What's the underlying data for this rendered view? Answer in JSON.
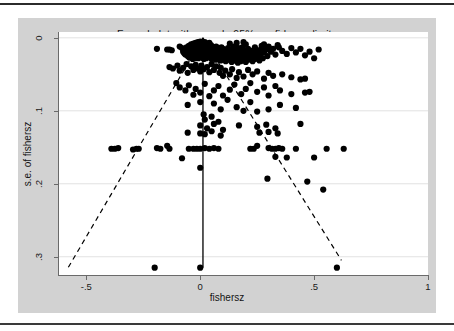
{
  "figure": {
    "title": "Funnel plot with pseudo 95% confidence limits",
    "panel_background": "#d2d2d2",
    "plot_background": "#ffffff",
    "axis_color": "#6a6a6a",
    "grid_color": "#e2e2e2",
    "point_color": "#000000",
    "line_color": "#000000"
  },
  "chart_data": {
    "type": "scatter",
    "title": "Funnel plot with pseudo 95% confidence limits",
    "xlabel": "fishersz",
    "ylabel": "s.e. of fishersz",
    "xlim": [
      -0.62,
      1.0
    ],
    "ylim": [
      0.325,
      -0.008
    ],
    "y_inverted": true,
    "grid": true,
    "grid_axis": "y",
    "legend": "none",
    "xticks": [
      -0.5,
      0,
      0.5,
      1
    ],
    "xticklabels": [
      "-.5",
      "0",
      ".5",
      "1"
    ],
    "yticks": [
      0,
      0.1,
      0.2,
      0.3
    ],
    "yticklabels": [
      "0",
      ".1",
      ".2",
      ".3"
    ],
    "annotations": [
      {
        "name": "pooled-effect-line",
        "type": "vertical-line",
        "style": "solid",
        "x": 0.012,
        "y_from": 0.0,
        "y_to": 0.315
      },
      {
        "name": "pseudo-95-ci-left",
        "type": "line",
        "style": "dashed",
        "from": [
          0.012,
          0.0
        ],
        "to": [
          -0.58,
          0.315
        ]
      },
      {
        "name": "pseudo-95-ci-right",
        "type": "line",
        "style": "dashed",
        "from": [
          0.012,
          0.0
        ],
        "to": [
          0.62,
          0.305
        ]
      }
    ],
    "points": [
      [
        -0.19,
        0.015
      ],
      [
        -0.145,
        0.016
      ],
      [
        -0.135,
        0.016
      ],
      [
        -0.125,
        0.017
      ],
      [
        -0.09,
        0.012
      ],
      [
        -0.08,
        0.014
      ],
      [
        -0.075,
        0.019
      ],
      [
        -0.07,
        0.021
      ],
      [
        -0.065,
        0.023
      ],
      [
        -0.06,
        0.013
      ],
      [
        -0.058,
        0.018
      ],
      [
        -0.055,
        0.025
      ],
      [
        -0.05,
        0.011
      ],
      [
        -0.05,
        0.02
      ],
      [
        -0.048,
        0.027
      ],
      [
        -0.045,
        0.014
      ],
      [
        -0.043,
        0.022
      ],
      [
        -0.04,
        0.009
      ],
      [
        -0.04,
        0.017
      ],
      [
        -0.038,
        0.026
      ],
      [
        -0.035,
        0.012
      ],
      [
        -0.035,
        0.021
      ],
      [
        -0.033,
        0.029
      ],
      [
        -0.03,
        0.008
      ],
      [
        -0.03,
        0.015
      ],
      [
        -0.028,
        0.019
      ],
      [
        -0.028,
        0.024
      ],
      [
        -0.025,
        0.01
      ],
      [
        -0.025,
        0.016
      ],
      [
        -0.023,
        0.022
      ],
      [
        -0.022,
        0.028
      ],
      [
        -0.02,
        0.007
      ],
      [
        -0.02,
        0.013
      ],
      [
        -0.018,
        0.018
      ],
      [
        -0.018,
        0.023
      ],
      [
        -0.016,
        0.027
      ],
      [
        -0.015,
        0.009
      ],
      [
        -0.015,
        0.015
      ],
      [
        -0.013,
        0.02
      ],
      [
        -0.012,
        0.025
      ],
      [
        -0.01,
        0.006
      ],
      [
        -0.01,
        0.011
      ],
      [
        -0.01,
        0.017
      ],
      [
        -0.008,
        0.022
      ],
      [
        -0.008,
        0.028
      ],
      [
        -0.006,
        0.008
      ],
      [
        -0.005,
        0.013
      ],
      [
        -0.005,
        0.019
      ],
      [
        -0.004,
        0.024
      ],
      [
        -0.003,
        0.01
      ],
      [
        -0.002,
        0.016
      ],
      [
        -0.002,
        0.021
      ],
      [
        0.0,
        0.005
      ],
      [
        0.0,
        0.012
      ],
      [
        0.0,
        0.018
      ],
      [
        0.0,
        0.026
      ],
      [
        0.002,
        0.008
      ],
      [
        0.003,
        0.014
      ],
      [
        0.004,
        0.02
      ],
      [
        0.005,
        0.01
      ],
      [
        0.005,
        0.023
      ],
      [
        0.007,
        0.006
      ],
      [
        0.008,
        0.016
      ],
      [
        0.008,
        0.027
      ],
      [
        0.01,
        0.011
      ],
      [
        0.01,
        0.019
      ],
      [
        0.012,
        0.007
      ],
      [
        0.012,
        0.014
      ],
      [
        0.013,
        0.024
      ],
      [
        0.015,
        0.009
      ],
      [
        0.015,
        0.017
      ],
      [
        0.016,
        0.029
      ],
      [
        0.018,
        0.012
      ],
      [
        0.018,
        0.021
      ],
      [
        0.02,
        0.006
      ],
      [
        0.02,
        0.015
      ],
      [
        0.022,
        0.025
      ],
      [
        0.023,
        0.01
      ],
      [
        0.024,
        0.019
      ],
      [
        0.025,
        0.013
      ],
      [
        0.026,
        0.028
      ],
      [
        0.028,
        0.008
      ],
      [
        0.028,
        0.017
      ],
      [
        0.03,
        0.022
      ],
      [
        0.03,
        0.011
      ],
      [
        0.032,
        0.026
      ],
      [
        0.033,
        0.014
      ],
      [
        0.035,
        0.009
      ],
      [
        0.035,
        0.019
      ],
      [
        0.037,
        0.024
      ],
      [
        0.038,
        0.012
      ],
      [
        0.04,
        0.016
      ],
      [
        0.04,
        0.007
      ],
      [
        0.042,
        0.021
      ],
      [
        0.043,
        0.027
      ],
      [
        0.045,
        0.013
      ],
      [
        0.045,
        0.018
      ],
      [
        0.047,
        0.01
      ],
      [
        0.048,
        0.023
      ],
      [
        0.05,
        0.015
      ],
      [
        0.05,
        0.029
      ],
      [
        0.052,
        0.019
      ],
      [
        0.053,
        0.012
      ],
      [
        0.055,
        0.025
      ],
      [
        0.056,
        0.016
      ],
      [
        0.058,
        0.021
      ],
      [
        0.06,
        0.013
      ],
      [
        0.06,
        0.027
      ],
      [
        0.062,
        0.018
      ],
      [
        0.065,
        0.023
      ],
      [
        0.065,
        0.015
      ],
      [
        0.068,
        0.03
      ],
      [
        0.07,
        0.02
      ],
      [
        0.07,
        0.012
      ],
      [
        0.072,
        0.026
      ],
      [
        0.075,
        0.017
      ],
      [
        0.078,
        0.022
      ],
      [
        0.08,
        0.014
      ],
      [
        0.08,
        0.028
      ],
      [
        0.083,
        0.019
      ],
      [
        0.085,
        0.024
      ],
      [
        0.088,
        0.016
      ],
      [
        0.09,
        0.021
      ],
      [
        0.09,
        0.031
      ],
      [
        0.093,
        0.013
      ],
      [
        0.095,
        0.026
      ],
      [
        0.098,
        0.018
      ],
      [
        0.1,
        0.023
      ],
      [
        0.1,
        0.015
      ],
      [
        0.103,
        0.029
      ],
      [
        0.105,
        0.02
      ],
      [
        0.108,
        0.025
      ],
      [
        0.11,
        0.017
      ],
      [
        0.112,
        0.032
      ],
      [
        0.115,
        0.022
      ],
      [
        0.118,
        0.027
      ],
      [
        0.12,
        0.019
      ],
      [
        0.122,
        0.014
      ],
      [
        0.125,
        0.024
      ],
      [
        0.128,
        0.03
      ],
      [
        0.13,
        0.021
      ],
      [
        0.133,
        0.016
      ],
      [
        0.135,
        0.026
      ],
      [
        0.138,
        0.033
      ],
      [
        0.14,
        0.023
      ],
      [
        0.143,
        0.018
      ],
      [
        0.145,
        0.028
      ],
      [
        0.148,
        0.012
      ],
      [
        0.15,
        0.025
      ],
      [
        0.153,
        0.02
      ],
      [
        0.155,
        0.031
      ],
      [
        0.158,
        0.016
      ],
      [
        0.16,
        0.027
      ],
      [
        0.163,
        0.022
      ],
      [
        0.165,
        0.034
      ],
      [
        0.168,
        0.014
      ],
      [
        0.17,
        0.029
      ],
      [
        0.173,
        0.024
      ],
      [
        0.175,
        0.018
      ],
      [
        0.178,
        0.032
      ],
      [
        0.18,
        0.026
      ],
      [
        0.183,
        0.021
      ],
      [
        0.185,
        0.013
      ],
      [
        0.188,
        0.03
      ],
      [
        0.19,
        0.023
      ],
      [
        0.193,
        0.017
      ],
      [
        0.195,
        0.028
      ],
      [
        0.2,
        0.02
      ],
      [
        0.2,
        0.033
      ],
      [
        0.205,
        0.025
      ],
      [
        0.21,
        0.015
      ],
      [
        0.21,
        0.03
      ],
      [
        0.215,
        0.022
      ],
      [
        0.22,
        0.027
      ],
      [
        0.225,
        0.018
      ],
      [
        0.23,
        0.032
      ],
      [
        0.235,
        0.024
      ],
      [
        0.24,
        0.013
      ],
      [
        0.24,
        0.029
      ],
      [
        0.245,
        0.02
      ],
      [
        0.25,
        0.026
      ],
      [
        0.255,
        0.017
      ],
      [
        0.26,
        0.031
      ],
      [
        0.265,
        0.023
      ],
      [
        0.27,
        0.014
      ],
      [
        0.275,
        0.028
      ],
      [
        0.28,
        0.02
      ],
      [
        0.29,
        0.016
      ],
      [
        0.295,
        0.025
      ],
      [
        0.3,
        0.013
      ],
      [
        0.31,
        0.019
      ],
      [
        0.32,
        0.015
      ],
      [
        0.33,
        0.023
      ],
      [
        0.345,
        0.013
      ],
      [
        0.36,
        0.018
      ],
      [
        0.38,
        0.022
      ],
      [
        0.4,
        0.014
      ],
      [
        0.42,
        0.02
      ],
      [
        0.44,
        0.015
      ],
      [
        0.46,
        0.024
      ],
      [
        0.48,
        0.019
      ],
      [
        0.5,
        0.028
      ],
      [
        0.52,
        0.016
      ],
      [
        0.27,
        0.011
      ],
      [
        0.28,
        0.009
      ],
      [
        0.3,
        0.012
      ],
      [
        0.34,
        0.01
      ],
      [
        0.13,
        0.008
      ],
      [
        0.16,
        0.007
      ],
      [
        0.19,
        0.006
      ],
      [
        0.2,
        0.009
      ],
      [
        -0.135,
        0.04
      ],
      [
        -0.12,
        0.042
      ],
      [
        -0.1,
        0.038
      ],
      [
        -0.09,
        0.045
      ],
      [
        -0.075,
        0.041
      ],
      [
        -0.06,
        0.036
      ],
      [
        -0.055,
        0.048
      ],
      [
        -0.04,
        0.039
      ],
      [
        -0.03,
        0.044
      ],
      [
        -0.02,
        0.037
      ],
      [
        -0.01,
        0.042
      ],
      [
        0.0,
        0.046
      ],
      [
        0.005,
        0.038
      ],
      [
        0.015,
        0.043
      ],
      [
        0.03,
        0.04
      ],
      [
        0.04,
        0.047
      ],
      [
        0.05,
        0.036
      ],
      [
        0.06,
        0.044
      ],
      [
        0.07,
        0.039
      ],
      [
        0.085,
        0.048
      ],
      [
        0.09,
        0.041
      ],
      [
        0.1,
        0.052
      ],
      [
        0.11,
        0.045
      ],
      [
        0.13,
        0.05
      ],
      [
        0.14,
        0.043
      ],
      [
        0.16,
        0.055
      ],
      [
        0.17,
        0.047
      ],
      [
        0.19,
        0.053
      ],
      [
        0.21,
        0.044
      ],
      [
        0.23,
        0.05
      ],
      [
        0.25,
        0.046
      ],
      [
        0.28,
        0.056
      ],
      [
        0.3,
        0.048
      ],
      [
        0.32,
        0.052
      ],
      [
        0.36,
        0.05
      ],
      [
        0.4,
        0.054
      ],
      [
        0.44,
        0.057
      ],
      [
        0.46,
        0.056
      ],
      [
        -0.105,
        0.062
      ],
      [
        -0.09,
        0.068
      ],
      [
        -0.065,
        0.072
      ],
      [
        -0.05,
        0.065
      ],
      [
        -0.03,
        0.078
      ],
      [
        -0.02,
        0.07
      ],
      [
        0.0,
        0.075
      ],
      [
        0.02,
        0.063
      ],
      [
        0.04,
        0.08
      ],
      [
        0.06,
        0.072
      ],
      [
        0.08,
        0.066
      ],
      [
        0.1,
        0.079
      ],
      [
        0.13,
        0.071
      ],
      [
        0.15,
        0.064
      ],
      [
        0.18,
        0.077
      ],
      [
        0.2,
        0.07
      ],
      [
        0.22,
        0.062
      ],
      [
        0.25,
        0.074
      ],
      [
        0.28,
        0.068
      ],
      [
        0.3,
        0.079
      ],
      [
        0.33,
        0.066
      ],
      [
        0.35,
        0.072
      ],
      [
        0.4,
        0.077
      ],
      [
        0.46,
        0.075
      ],
      [
        0.48,
        0.074
      ],
      [
        -0.055,
        0.092
      ],
      [
        0.0,
        0.088
      ],
      [
        0.06,
        0.09
      ],
      [
        0.09,
        0.098
      ],
      [
        0.12,
        0.085
      ],
      [
        0.16,
        0.095
      ],
      [
        0.19,
        0.1
      ],
      [
        0.22,
        0.088
      ],
      [
        0.25,
        0.101
      ],
      [
        0.3,
        0.098
      ],
      [
        0.35,
        0.092
      ],
      [
        0.42,
        0.096
      ],
      [
        0.015,
        0.105
      ],
      [
        0.02,
        0.112
      ],
      [
        0.05,
        0.108
      ],
      [
        0.08,
        0.115
      ],
      [
        0.0,
        0.12
      ],
      [
        0.03,
        0.124
      ],
      [
        0.06,
        0.118
      ],
      [
        0.1,
        0.126
      ],
      [
        0.17,
        0.12
      ],
      [
        0.25,
        0.122
      ],
      [
        0.29,
        0.119
      ],
      [
        0.33,
        0.124
      ],
      [
        0.44,
        0.118
      ],
      [
        -0.055,
        0.13
      ],
      [
        0.0,
        0.131
      ],
      [
        0.02,
        0.132
      ],
      [
        0.05,
        0.128
      ],
      [
        0.09,
        0.134
      ],
      [
        0.26,
        0.13
      ],
      [
        0.3,
        0.129
      ],
      [
        0.34,
        0.131
      ],
      [
        -0.39,
        0.152
      ],
      [
        -0.375,
        0.152
      ],
      [
        -0.36,
        0.151
      ],
      [
        -0.295,
        0.153
      ],
      [
        -0.28,
        0.152
      ],
      [
        -0.27,
        0.152
      ],
      [
        -0.19,
        0.151
      ],
      [
        -0.175,
        0.152
      ],
      [
        -0.145,
        0.148
      ],
      [
        -0.135,
        0.152
      ],
      [
        -0.05,
        0.152
      ],
      [
        -0.03,
        0.152
      ],
      [
        -0.015,
        0.152
      ],
      [
        0.0,
        0.152
      ],
      [
        0.02,
        0.151
      ],
      [
        0.04,
        0.152
      ],
      [
        0.06,
        0.151
      ],
      [
        0.08,
        0.152
      ],
      [
        0.22,
        0.152
      ],
      [
        0.235,
        0.152
      ],
      [
        0.25,
        0.148
      ],
      [
        0.3,
        0.151
      ],
      [
        0.315,
        0.152
      ],
      [
        0.33,
        0.152
      ],
      [
        0.345,
        0.151
      ],
      [
        0.36,
        0.152
      ],
      [
        0.42,
        0.152
      ],
      [
        0.555,
        0.152
      ],
      [
        0.63,
        0.152
      ],
      [
        -0.08,
        0.165
      ],
      [
        0.33,
        0.163
      ],
      [
        0.38,
        0.164
      ],
      [
        0.5,
        0.164
      ],
      [
        0.0,
        0.178
      ],
      [
        0.295,
        0.193
      ],
      [
        0.47,
        0.197
      ],
      [
        0.54,
        0.208
      ],
      [
        -0.2,
        0.315
      ],
      [
        0.0,
        0.315
      ],
      [
        0.6,
        0.315
      ]
    ]
  }
}
